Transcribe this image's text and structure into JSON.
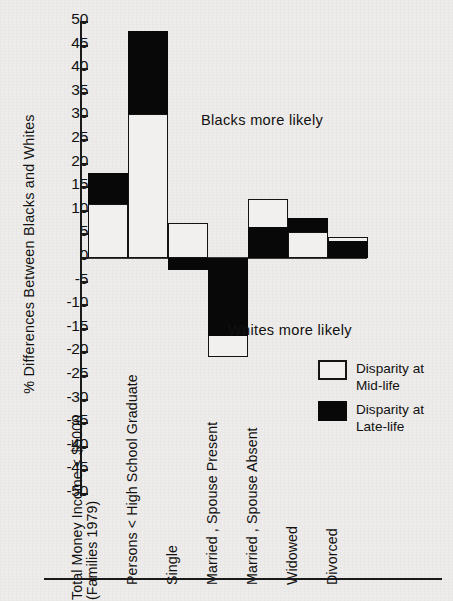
{
  "figure": {
    "ylabel": "% Differences Between Blacks and Whites",
    "annotations": [
      {
        "name": "blacks-more-likely",
        "text": "Blacks more likely"
      },
      {
        "name": "whites-more-likely",
        "text": "Whites more likely"
      }
    ]
  },
  "legend": {
    "items": [
      {
        "swatch": "white",
        "line1": "Disparity at",
        "line2": "Mid-life"
      },
      {
        "swatch": "black",
        "line1": "Disparity at",
        "line2": "Late-life"
      }
    ]
  },
  "axis": {
    "ticks": [
      "50",
      "45",
      "40",
      "35",
      "30",
      "25",
      "20",
      "15",
      "10",
      "5",
      "0",
      "-5",
      "-10",
      "-15",
      "-20",
      "-25",
      "-30",
      "-35",
      "-40",
      "-45",
      "-50"
    ]
  },
  "categories": [
    {
      "line1": "Total Money Income < $5000",
      "line2": "(Families 1979)"
    },
    {
      "line1": "Persons < High School Graduate",
      "line2": ""
    },
    {
      "line1": "Single",
      "line2": ""
    },
    {
      "line1": "Married , Spouse Present",
      "line2": ""
    },
    {
      "line1": "Married , Spouse Absent",
      "line2": ""
    },
    {
      "line1": "Widowed",
      "line2": ""
    },
    {
      "line1": "Divorced",
      "line2": ""
    }
  ],
  "chart_data": {
    "type": "bar",
    "title": "",
    "xlabel": "",
    "ylabel": "% Differences Between Blacks and Whites",
    "ylim": [
      -50,
      50
    ],
    "ytick_step": 5,
    "grid": false,
    "legend_position": "right-lower",
    "stacked": true,
    "note": "Each category shows two nested/stacked disparity values; the mid-life value and the late-life value share the same zero baseline.",
    "categories": [
      "Total Money Income < $5000 (Families 1979)",
      "Persons < High School Graduate",
      "Single",
      "Married , Spouse Present",
      "Married , Spouse Absent",
      "Widowed",
      "Divorced"
    ],
    "series": [
      {
        "name": "Disparity at Mid-life",
        "color": "#ffffff",
        "values": [
          11.5,
          30.5,
          7.5,
          -21.0,
          12.5,
          5.5,
          4.5
        ]
      },
      {
        "name": "Disparity at Late-life",
        "color": "#000000",
        "values": [
          18.0,
          48.0,
          -2.5,
          -16.5,
          6.5,
          8.5,
          3.5
        ]
      }
    ],
    "annotations": [
      {
        "text": "Blacks more likely",
        "region": "above zero line"
      },
      {
        "text": "Whites more likely",
        "region": "below zero line"
      }
    ]
  },
  "render": {
    "zero_y": 258,
    "px_per_unit": 4.72,
    "bar_left": 8,
    "bar_width": 40,
    "bars": [
      {
        "i": 0,
        "mid": 11.5,
        "late": 18.0,
        "mid_on_top": false
      },
      {
        "i": 1,
        "mid": 30.5,
        "late": 48.0,
        "mid_on_top": false
      },
      {
        "i": 2,
        "mid": 7.5,
        "late": -2.5,
        "mid_on_top": false
      },
      {
        "i": 3,
        "mid": -21.0,
        "late": -16.5,
        "mid_on_top": false
      },
      {
        "i": 4,
        "mid": 12.5,
        "late": 6.5,
        "mid_on_top": false
      },
      {
        "i": 5,
        "mid": 5.5,
        "late": 8.5,
        "mid_on_top": false
      },
      {
        "i": 6,
        "mid": 4.5,
        "late": 3.5,
        "mid_on_top": false
      }
    ]
  }
}
